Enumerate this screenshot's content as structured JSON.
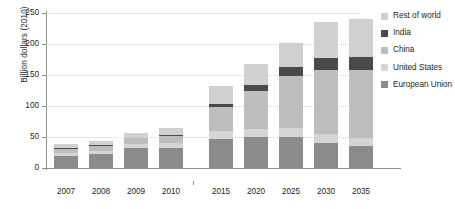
{
  "chart_data": {
    "type": "bar",
    "title": "",
    "subtitle": "",
    "xlabel": "",
    "ylabel": "Billion dollars (2010)",
    "ylim": [
      0,
      250
    ],
    "yticks": [
      0,
      50,
      100,
      150,
      200,
      250
    ],
    "ytick_labels": [
      "0",
      "50",
      "100",
      "150",
      "200",
      "250"
    ],
    "grid": true,
    "grid_style": "dotted",
    "stacked": true,
    "legend_position": "right",
    "axis_break": true,
    "categories": [
      "2007",
      "2008",
      "2009",
      "2010",
      "2015",
      "2020",
      "2025",
      "2030",
      "2035"
    ],
    "series": [
      {
        "name": "European Union",
        "color": "#8b8b8b",
        "values": [
          20,
          22,
          32,
          33,
          47,
          50,
          50,
          41,
          35
        ]
      },
      {
        "name": "United States",
        "color": "#d5d5d5",
        "values": [
          5,
          6,
          7,
          8,
          12,
          13,
          14,
          14,
          14
        ]
      },
      {
        "name": "China",
        "color": "#bdbdbd",
        "values": [
          6,
          8,
          9,
          11,
          39,
          62,
          85,
          103,
          109
        ]
      },
      {
        "name": "India",
        "color": "#4a4a4a",
        "values": [
          1,
          1,
          1,
          1,
          5,
          9,
          14,
          20,
          21
        ]
      },
      {
        "name": "Rest of world",
        "color": "#d0d0d0",
        "values": [
          6,
          7,
          8,
          11,
          30,
          34,
          38,
          58,
          61
        ]
      }
    ],
    "totals": [
      38,
      44,
      57,
      64,
      133,
      168,
      201,
      236,
      240
    ]
  },
  "legend": {
    "entries": [
      {
        "label": "Rest of world",
        "color": "#d0d0d0"
      },
      {
        "label": "India",
        "color": "#4a4a4a"
      },
      {
        "label": "China",
        "color": "#bdbdbd"
      },
      {
        "label": "United States",
        "color": "#d5d5d5"
      },
      {
        "label": "European Union",
        "color": "#8b8b8b"
      }
    ]
  },
  "style": {
    "axis_color": "#8c8c8c",
    "grid_color": "#d2d2d2",
    "text_color": "#231f20",
    "background": "#ffffff"
  }
}
